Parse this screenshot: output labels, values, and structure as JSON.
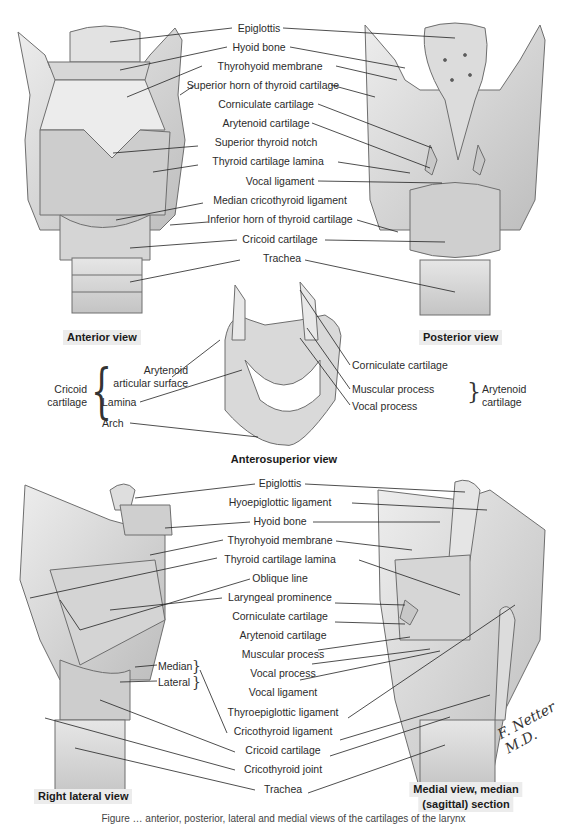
{
  "figure": {
    "caption": "Figure … anterior, posterior, lateral and medial views of the cartilages of the larynx",
    "signature": "F. Netter M.D."
  },
  "views": {
    "anterior": {
      "title": "Anterior view"
    },
    "posterior": {
      "title": "Posterior view"
    },
    "anterosuperior": {
      "title": "Anterosuperior view"
    },
    "right_lateral": {
      "title": "Right lateral view"
    },
    "medial": {
      "title_line1": "Medial view, median",
      "title_line2": "(sagittal) section"
    }
  },
  "top_labels": [
    "Epiglottis",
    "Hyoid bone",
    "Thyrohyoid membrane",
    "Superior horn of thyroid cartilage",
    "Corniculate cartilage",
    "Arytenoid cartilage",
    "Superior thyroid notch",
    "Thyroid cartilage lamina",
    "Vocal ligament",
    "Median cricothyroid ligament",
    "Inferior horn of thyroid cartilage",
    "Cricoid cartilage",
    "Trachea"
  ],
  "middle": {
    "group_left": "Cricoid cartilage",
    "group_left_line1": "Cricoid",
    "group_left_line2": "cartilage",
    "left_labels": [
      "Arytenoid",
      "articular surface",
      "Lamina",
      "Arch"
    ],
    "right_labels": [
      "Corniculate cartilage",
      "Muscular process",
      "Vocal process"
    ],
    "group_right_line1": "Arytenoid",
    "group_right_line2": "cartilage"
  },
  "bottom_labels": [
    "Epiglottis",
    "Hyoepiglottic ligament",
    "Hyoid bone",
    "Thyrohyoid membrane",
    "Thyroid cartilage lamina",
    "Oblique line",
    "Laryngeal prominence",
    "Corniculate cartilage",
    "Arytenoid cartilage",
    "Muscular process",
    "Vocal process",
    "Vocal ligament",
    "Thyroepiglottic ligament",
    "Cricothyroid ligament",
    "Cricoid cartilage",
    "Cricothyroid joint",
    "Trachea"
  ],
  "lateral_sub_labels": [
    "Median",
    "Lateral"
  ],
  "colors": {
    "cartilage_light": "#e4e4e4",
    "cartilage_mid": "#c9c9c9",
    "cartilage_dark": "#9a9a9a",
    "outline": "#6e6e6e",
    "leader": "#222222",
    "title_bg": "#ececec"
  }
}
